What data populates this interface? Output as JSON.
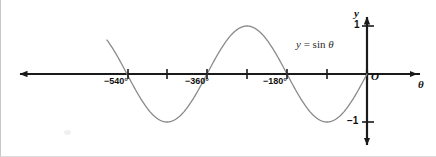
{
  "figure": {
    "annotation": {
      "lhs": "y",
      "eq": "=",
      "rhs": "sin",
      "var": "θ"
    },
    "origin_label": "O",
    "x_axis_label": "θ",
    "y_axis_label": "y"
  },
  "colors": {
    "curve": "#8a8a8a",
    "axis": "#1a1a1a",
    "text": "#111111",
    "background": "#ffffff",
    "border": "#c9c9c9"
  },
  "ticks": {
    "x_labeled": [
      {
        "value": -540,
        "label": "−540°"
      },
      {
        "value": -360,
        "label": "−360°"
      },
      {
        "value": -180,
        "label": "−180°"
      }
    ],
    "x_unlabeled": [
      -450,
      -270,
      -90
    ],
    "y_labeled": [
      {
        "value": 1,
        "label": "1"
      },
      {
        "value": -1,
        "label": "−1"
      }
    ]
  },
  "chart_data": {
    "type": "line",
    "xlabel": "θ",
    "ylabel": "y",
    "xlim": [
      -620,
      70
    ],
    "ylim": [
      -1.55,
      1.55
    ],
    "grid": false,
    "legend": "none",
    "x_tick_labels": [
      "−540°",
      "−360°",
      "−180°"
    ],
    "x_tick_values": [
      -540,
      -360,
      -180
    ],
    "x_minor_tick_values": [
      -450,
      -270,
      -90
    ],
    "y_tick_labels": [
      "1",
      "−1"
    ],
    "y_tick_values": [
      1,
      -1
    ],
    "annotations": [
      {
        "text": "y = sin θ",
        "x": -300,
        "y": 0.72
      },
      {
        "text": "O",
        "x": 15,
        "y": -0.2
      }
    ],
    "series": [
      {
        "name": "y = sin θ",
        "equation": "y = sin(theta)",
        "amplitude": 1,
        "period": 360,
        "domain_degrees": [
          -585,
          0
        ],
        "x": [
          -585,
          -570,
          -540,
          -510,
          -480,
          -450,
          -420,
          -390,
          -360,
          -330,
          -300,
          -270,
          -240,
          -210,
          -180,
          -150,
          -120,
          -90,
          -60,
          -30,
          0
        ],
        "y": [
          0.707,
          0.5,
          0.0,
          -0.5,
          -0.866,
          -1.0,
          -0.866,
          -0.5,
          0.0,
          0.5,
          0.866,
          1.0,
          0.866,
          0.5,
          0.0,
          -0.5,
          -0.866,
          -1.0,
          -0.866,
          -0.5,
          0.0
        ],
        "key_points": {
          "zeros": [
            -540,
            -360,
            -180,
            0
          ],
          "maxima": [
            {
              "x": -270,
              "y": 1
            }
          ],
          "minima": [
            {
              "x": -450,
              "y": -1
            },
            {
              "x": -90,
              "y": -1
            }
          ]
        }
      }
    ]
  }
}
